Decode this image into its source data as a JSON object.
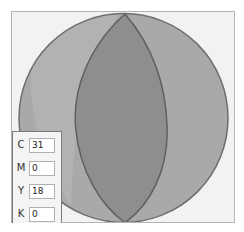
{
  "visualization": {
    "type": "color-sphere-wheel",
    "background_color": "#f2f2f2",
    "outer_fill": "#a9a9a9",
    "highlight_fill": "#b9b9b9",
    "lens_fill": "#8e8e8e",
    "stroke_color": "#6e6e6e"
  },
  "cmyk_panel": {
    "fields": [
      {
        "label": "C",
        "value": "31"
      },
      {
        "label": "M",
        "value": "0"
      },
      {
        "label": "Y",
        "value": "18"
      },
      {
        "label": "K",
        "value": "0"
      }
    ]
  }
}
